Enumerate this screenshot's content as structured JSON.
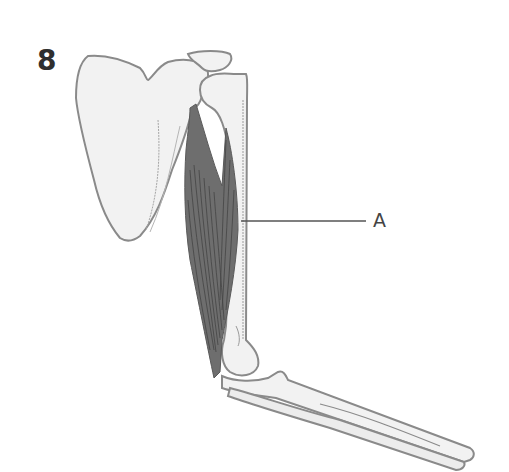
{
  "figure": {
    "number": "8",
    "labels": [
      {
        "id": "A",
        "text": "A"
      }
    ]
  },
  "colors": {
    "background": "#ffffff",
    "bone_fill": "#f2f2f2",
    "outline": "#8a8a8a",
    "muscle": "#6e6e6e",
    "muscle_fiber": "#3e3e3e",
    "leader_line": "#555555",
    "text": "#2f2f2f"
  }
}
